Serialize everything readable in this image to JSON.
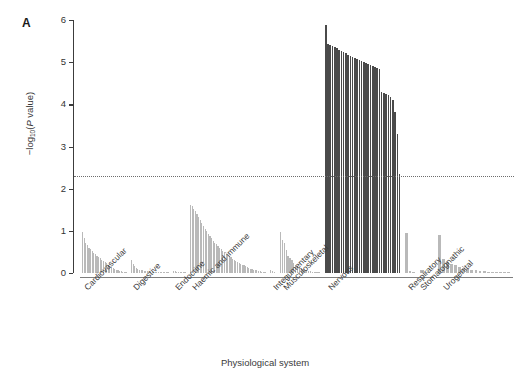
{
  "panel": {
    "letter": "A"
  },
  "axes": {
    "ylabel_prefix": "−log",
    "ylabel_sub": "10",
    "ylabel_mid": "(",
    "ylabel_italic": "P",
    "ylabel_suffix": " value)",
    "ylabel_plain": "−log10(P value)",
    "xlabel": "Physiological system",
    "yticks": [
      "0",
      "1",
      "2",
      "3",
      "4",
      "5",
      "6"
    ],
    "ymin": 0,
    "ymax": 6
  },
  "threshold": {
    "value": 2.3,
    "style": "dotted",
    "color": "#6d6d6d"
  },
  "colors": {
    "bar_light": "#b9b9b9",
    "bar_dark": "#4a4a4a",
    "axis": "#3c3c3c",
    "text": "#333333"
  },
  "chart_data": {
    "type": "bar",
    "title": "",
    "xlabel": "Physiological system",
    "ylabel": "-log10(P value)",
    "ylim": [
      0,
      6
    ],
    "grid": false,
    "legend": null,
    "annotations": [
      {
        "type": "hline",
        "y": 2.3,
        "label": "significance threshold",
        "style": "dotted"
      }
    ],
    "categories": [
      "Cardiovascular",
      "Digestive",
      "Endocrine",
      "Haemic and immune",
      "Integumentary",
      "Musculoskeletal",
      "Nervous",
      "Respiratory",
      "Stomatognathic",
      "Urogenital"
    ],
    "groups": [
      {
        "name": "Cardiovascular",
        "values": [
          0.97,
          0.82,
          0.72,
          0.66,
          0.6,
          0.56,
          0.52,
          0.48,
          0.44,
          0.41,
          0.38,
          0.35,
          0.32,
          0.29,
          0.26,
          0.23,
          0.2,
          0.17,
          0.15,
          0.12,
          0.1,
          0.08,
          0.06,
          0.05,
          0.04,
          0.03,
          0.02,
          0.01
        ]
      },
      {
        "name": "Digestive",
        "values": [
          0.3,
          0.22,
          0.17,
          0.13,
          0.1,
          0.08,
          0.07,
          0.06,
          0.05,
          0.04,
          0.04,
          0.03,
          0.03,
          0.02,
          0.02,
          0.02,
          0.01,
          0.01,
          0.01,
          0.01,
          0.01,
          0.01,
          0.005,
          0.005
        ]
      },
      {
        "name": "Endocrine",
        "values": [
          0.05,
          0.04,
          0.03,
          0.02,
          0.02,
          0.01,
          0.01,
          0.01
        ]
      },
      {
        "name": "Haemic and immune",
        "values": [
          1.62,
          1.58,
          1.52,
          1.46,
          1.4,
          1.33,
          1.26,
          1.19,
          1.12,
          1.05,
          0.99,
          0.93,
          0.87,
          0.82,
          0.77,
          0.72,
          0.68,
          0.64,
          0.6,
          0.56,
          0.52,
          0.49,
          0.46,
          0.43,
          0.4,
          0.37,
          0.34,
          0.31,
          0.28,
          0.26,
          0.24,
          0.22,
          0.2,
          0.18,
          0.16,
          0.14,
          0.12,
          0.1,
          0.09,
          0.08,
          0.07,
          0.06,
          0.05,
          0.04,
          0.03,
          0.02,
          0.01
        ]
      },
      {
        "name": "Integumentary",
        "values": [
          0.08,
          0.04,
          0.02
        ]
      },
      {
        "name": "Musculoskeletal",
        "values": [
          0.97,
          0.78,
          0.7,
          0.55,
          0.4,
          0.36,
          0.3,
          0.24,
          0.2,
          0.16,
          0.13,
          0.11,
          0.09,
          0.07,
          0.06,
          0.05,
          0.04,
          0.03,
          0.02,
          0.02,
          0.01,
          0.01
        ]
      },
      {
        "name": "Nervous",
        "values": [
          5.88,
          5.42,
          5.4,
          5.38,
          5.36,
          5.33,
          5.3,
          5.27,
          5.24,
          5.21,
          5.18,
          5.15,
          5.12,
          5.1,
          5.08,
          5.06,
          5.03,
          5.0,
          4.98,
          4.96,
          4.94,
          4.9,
          4.88,
          4.86,
          4.84,
          4.3,
          4.28,
          4.25,
          4.22,
          4.18,
          4.1,
          3.82,
          3.3,
          2.34
        ]
      },
      {
        "name": "Respiratory",
        "values": [
          0.95,
          0.05,
          0.02
        ]
      },
      {
        "name": "Stomatognathic",
        "values": [
          0.06,
          0.03
        ]
      },
      {
        "name": "Urogenital",
        "values": [
          0.9,
          0.34,
          0.26,
          0.22,
          0.18,
          0.15,
          0.12,
          0.1,
          0.08,
          0.06,
          0.05,
          0.04,
          0.03,
          0.02,
          0.02,
          0.01,
          0.01,
          0.01
        ]
      }
    ]
  }
}
